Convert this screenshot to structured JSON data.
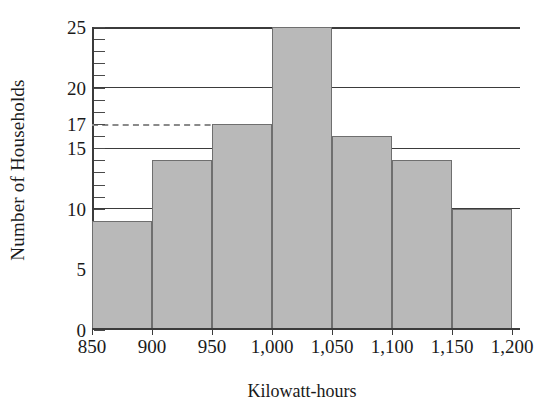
{
  "chart_data": {
    "type": "bar",
    "title": "",
    "subtitle": "",
    "xlabel": "Kilowatt-hours",
    "ylabel": "Number of Households",
    "categories": [
      "850-900",
      "900-950",
      "950-1,000",
      "1,000-1,050",
      "1,050-1,100",
      "1,100-1,150",
      "1,150-1,200"
    ],
    "bin_edges": [
      850,
      900,
      950,
      1000,
      1050,
      1100,
      1150,
      1200
    ],
    "values": [
      9,
      14,
      17,
      25,
      16,
      14,
      10
    ],
    "x_tick_labels": [
      "850",
      "900",
      "950",
      "1,000",
      "1,050",
      "1,100",
      "1,150",
      "1,200"
    ],
    "y_tick_labels": [
      "0",
      "5",
      "10",
      "15",
      "17",
      "20",
      "25"
    ],
    "y_tick_values": [
      0,
      5,
      10,
      15,
      17,
      20,
      25
    ],
    "y_gridline_values": [
      10,
      15,
      20,
      25
    ],
    "y_minor_tick_step": 1,
    "xlim": [
      850,
      1200
    ],
    "ylim": [
      0,
      25
    ],
    "grid": true,
    "legend": null,
    "annotations": [
      {
        "type": "dashed-reference-line",
        "value": 17,
        "label": "17",
        "orientation": "horizontal",
        "from_bin": 850,
        "to_bin": 1000,
        "color": "#8a8a8a"
      }
    ],
    "colors": {
      "bar_fill": "#b9b9b9",
      "bar_stroke": "#6f6f6f",
      "axis": "#3b3b3b",
      "dashed": "#8a8a8a",
      "text": "#1a1a1a",
      "background": "#ffffff"
    }
  }
}
